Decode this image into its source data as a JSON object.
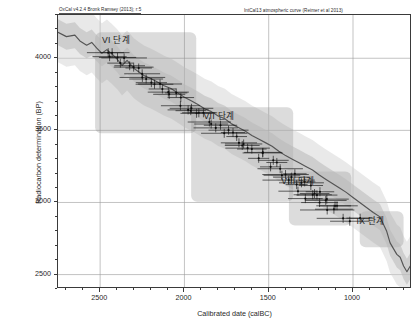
{
  "header": {
    "left_caption": "OxCal v4.2.4 Bronk Ramsey (2013); r:5",
    "right_caption": "IntCal13 atmospheric curve (Reimer et al 2013)"
  },
  "chart_data": {
    "type": "line",
    "title": "",
    "xlabel": "Calibrated date (calBC)",
    "ylabel": "Radiocarbon determination (BP)",
    "xlim": [
      2750,
      650
    ],
    "ylim": [
      2400,
      4300
    ],
    "x_ticks": [
      2500,
      2000,
      1500,
      1000
    ],
    "y_ticks": [
      4000,
      3500,
      3000,
      2500
    ],
    "x_direction": "decreasing",
    "grid": true,
    "legend": "none",
    "series": [
      {
        "name": "IntCal13 atmospheric calibration curve",
        "type": "line",
        "color": "#6f6f6f",
        "band": "1-sigma envelope",
        "x": [
          2750,
          2700,
          2650,
          2620,
          2580,
          2550,
          2520,
          2490,
          2460,
          2430,
          2400,
          2370,
          2340,
          2300,
          2270,
          2240,
          2200,
          2160,
          2120,
          2080,
          2040,
          2000,
          1960,
          1920,
          1880,
          1840,
          1800,
          1760,
          1720,
          1680,
          1640,
          1600,
          1560,
          1520,
          1480,
          1440,
          1400,
          1360,
          1320,
          1280,
          1240,
          1200,
          1160,
          1120,
          1080,
          1040,
          1000,
          960,
          920,
          880,
          840,
          800,
          780,
          760,
          740,
          720,
          700,
          680,
          660
        ],
        "y": [
          4180,
          4150,
          4160,
          4120,
          4090,
          4110,
          4070,
          4035,
          4060,
          4030,
          3995,
          3950,
          3985,
          3930,
          3905,
          3880,
          3860,
          3835,
          3810,
          3790,
          3760,
          3730,
          3705,
          3680,
          3650,
          3630,
          3600,
          3580,
          3545,
          3520,
          3495,
          3465,
          3440,
          3415,
          3390,
          3355,
          3325,
          3300,
          3275,
          3250,
          3225,
          3190,
          3160,
          3130,
          3100,
          3070,
          3035,
          3000,
          2965,
          2930,
          2900,
          2800,
          2720,
          2680,
          2640,
          2620,
          2560,
          2520,
          2560
        ]
      },
      {
        "name": "Measured radiocarbon determinations",
        "type": "scatter-errorbar",
        "color": "#1a1a1a",
        "note": "dense cluster of dated samples with horizontal 1-sigma calibrated ranges",
        "count": 62
      }
    ],
    "phases": [
      {
        "label": "VI 단계",
        "box": {
          "x1": 2530,
          "x2": 1930,
          "y1": 4180,
          "y2": 3480
        },
        "label_x": 2400,
        "label_y": 4165
      },
      {
        "label": "VII 단계",
        "box": {
          "x1": 1960,
          "x2": 1355,
          "y1": 3660,
          "y2": 3005
        },
        "label_x": 1790,
        "label_y": 3640
      },
      {
        "label": "VIII 단계",
        "box": {
          "x1": 1380,
          "x2": 1010,
          "y1": 3215,
          "y2": 2840
        },
        "label_x": 1320,
        "label_y": 3190
      },
      {
        "label": "IX 단계",
        "box": {
          "x1": 960,
          "x2": 700,
          "y1": 2940,
          "y2": 2690
        },
        "label_x": 890,
        "label_y": 2915
      }
    ]
  }
}
